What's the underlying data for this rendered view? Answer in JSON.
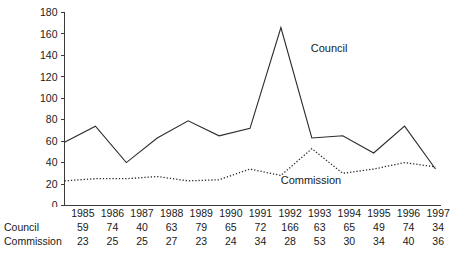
{
  "chart_data": {
    "type": "line",
    "title": "",
    "xlabel": "",
    "ylabel": "",
    "categories": [
      "1985",
      "1986",
      "1987",
      "1988",
      "1989",
      "1990",
      "1991",
      "1992",
      "1993",
      "1994",
      "1995",
      "1996",
      "1997"
    ],
    "series": [
      {
        "name": "Council",
        "style": "solid",
        "label": "Council",
        "values": [
          59,
          74,
          40,
          63,
          79,
          65,
          72,
          166,
          63,
          65,
          49,
          74,
          34
        ]
      },
      {
        "name": "Commission",
        "style": "dotted",
        "label": "Commission",
        "values": [
          23,
          25,
          25,
          27,
          23,
          24,
          34,
          28,
          53,
          30,
          34,
          40,
          36
        ]
      }
    ],
    "ylim": [
      0,
      180
    ],
    "ytick_values": [
      0,
      20,
      40,
      60,
      80,
      100,
      120,
      140,
      160,
      180
    ],
    "ytick_labels": [
      "0",
      "20",
      "40",
      "60",
      "80",
      "100",
      "120",
      "140",
      "160",
      "180"
    ],
    "grid": false,
    "legend": "inline-annotations",
    "annotations": [
      {
        "text": "Council",
        "x_frac": 0.655,
        "y_value": 143
      },
      {
        "text": "Commission",
        "x_frac": 0.575,
        "y_value": 20
      }
    ]
  },
  "table": {
    "row_header_years": "",
    "rows": [
      {
        "label": "Council",
        "values": [
          "59",
          "74",
          "40",
          "63",
          "79",
          "65",
          "72",
          "166",
          "63",
          "65",
          "49",
          "74",
          "34"
        ]
      },
      {
        "label": "Commission",
        "values": [
          "23",
          "25",
          "25",
          "27",
          "23",
          "24",
          "34",
          "28",
          "53",
          "30",
          "34",
          "40",
          "36"
        ]
      }
    ]
  },
  "colors": {
    "background": "#ffffff",
    "axis": "#3b3b3b",
    "text": "#1a1a1a",
    "series_line": "#2b2b2b"
  }
}
